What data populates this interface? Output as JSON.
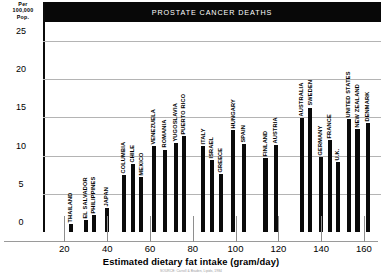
{
  "title": "PROSTATE CANCER DEATHS",
  "y_unit_lines": [
    "Per",
    "100,000",
    "Pop."
  ],
  "xaxis_title": "Estimated dietary fat intake (gram/day)",
  "source_note": "SOURCE: Carroll & Braden, Lipids, 1984",
  "colors": {
    "banner_background": "#080808",
    "banner_text": "#ffffff",
    "bar": "#0a0a0a",
    "gridline": "#b4b4b4",
    "axis": "#0b0b0b",
    "plot_background": "#ffffff"
  },
  "chart_data": {
    "type": "scatter",
    "title": "PROSTATE CANCER DEATHS",
    "subtitle": "",
    "xlabel": "Estimated dietary fat intake (gram/day)",
    "ylabel": "Per 100,000 Pop.",
    "xlim": [
      10,
      168
    ],
    "ylim": [
      0,
      27.5
    ],
    "xticks": [
      20,
      40,
      60,
      80,
      100,
      120,
      140,
      160
    ],
    "yticks": [
      0,
      5,
      10,
      15,
      20,
      25
    ],
    "grid": true,
    "legend": "none",
    "annotations": "Each vertical bar is a country positioned by dietary fat intake; bar height is prostate cancer death rate per 100,000 population.",
    "points": [
      {
        "label": "THAILAND",
        "x": 23,
        "y": 1.1
      },
      {
        "label": "EL SALVADOR",
        "x": 30,
        "y": 1.6
      },
      {
        "label": "PHILIPPINES",
        "x": 34,
        "y": 2.2
      },
      {
        "label": "JAPAN",
        "x": 40,
        "y": 3.1
      },
      {
        "label": "COLUMBIA",
        "x": 48,
        "y": 7.5
      },
      {
        "label": "CHILE",
        "x": 52,
        "y": 8.9
      },
      {
        "label": "MEXICO",
        "x": 56,
        "y": 7.2
      },
      {
        "label": "VENEZUELA",
        "x": 62,
        "y": 11.3
      },
      {
        "label": "ROMANIA",
        "x": 67,
        "y": 10.8
      },
      {
        "label": "YUGOSLAVIA",
        "x": 72,
        "y": 11.7
      },
      {
        "label": "PUERTO RICO",
        "x": 76,
        "y": 12.6
      },
      {
        "label": "ITALY",
        "x": 85,
        "y": 11.3
      },
      {
        "label": "ISRAEL",
        "x": 89,
        "y": 9.4
      },
      {
        "label": "GREECE",
        "x": 93,
        "y": 7.6
      },
      {
        "label": "HUNGARY",
        "x": 99,
        "y": 13.3
      },
      {
        "label": "SPAIN",
        "x": 104,
        "y": 11.5
      },
      {
        "label": "FINLAND",
        "x": 114,
        "y": 9.7
      },
      {
        "label": "AUSTRIA",
        "x": 119,
        "y": 11.4
      },
      {
        "label": "AUSTRALIA",
        "x": 131,
        "y": 14.9
      },
      {
        "label": "SWEDEN",
        "x": 135,
        "y": 16.3
      },
      {
        "label": "GERMANY",
        "x": 140,
        "y": 9.8
      },
      {
        "label": "FRANCE",
        "x": 144,
        "y": 12.1
      },
      {
        "label": "U.K.",
        "x": 148,
        "y": 9.2
      },
      {
        "label": "UNITED STATES",
        "x": 153,
        "y": 14.8
      },
      {
        "label": "NEW ZEALAND",
        "x": 157,
        "y": 13.5
      },
      {
        "label": "DENMARK",
        "x": 162,
        "y": 14.3
      }
    ]
  }
}
